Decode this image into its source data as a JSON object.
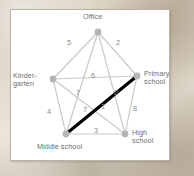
{
  "figure": {
    "type": "weighted-graph-diagram",
    "background": "#d8cfc0",
    "card_background": "#ffffff",
    "edge_color": "#c9c9c9",
    "node_color": "#b5b5b5",
    "highlight_color": "#000000",
    "label_color": "#6e6e6e",
    "weight_color": "#8a8a8a"
  },
  "nodes": [
    {
      "id": "office",
      "label": "Office",
      "x": 87,
      "y": 22,
      "label_x": 72,
      "label_y": 3,
      "label_lines": [
        "Office"
      ]
    },
    {
      "id": "kindergarten",
      "label": "Kinder-garten",
      "x": 42,
      "y": 69,
      "label_x": 2,
      "label_y": 62,
      "label_lines": [
        "Kinder-",
        "garten"
      ]
    },
    {
      "id": "primary_school",
      "label": "Primary school",
      "x": 126,
      "y": 66,
      "label_x": 133,
      "label_y": 60,
      "label_lines": [
        "Primary",
        "school"
      ]
    },
    {
      "id": "middle_school",
      "label": "Middle school",
      "x": 55,
      "y": 124,
      "label_x": 26,
      "label_y": 133,
      "label_lines": [
        "Middle school"
      ]
    },
    {
      "id": "high_school",
      "label": "High school",
      "x": 114,
      "y": 124,
      "label_x": 121,
      "label_y": 119,
      "label_lines": [
        "High",
        "school"
      ]
    }
  ],
  "edges": [
    {
      "from": "office",
      "to": "kindergarten",
      "weight": "5",
      "label_x": 56,
      "label_y": 29,
      "highlighted": false
    },
    {
      "from": "office",
      "to": "primary_school",
      "weight": "2",
      "label_x": 105,
      "label_y": 29,
      "highlighted": false
    },
    {
      "from": "office",
      "to": "middle_school",
      "weight": "6",
      "label_x": 80,
      "label_y": 62,
      "highlighted": false
    },
    {
      "from": "office",
      "to": "high_school",
      "weight": "2",
      "label_x": 103,
      "label_y": 79,
      "highlighted": false
    },
    {
      "from": "kindergarten",
      "to": "primary_school",
      "weight": "7",
      "label_x": 65,
      "label_y": 79,
      "highlighted": false
    },
    {
      "from": "kindergarten",
      "to": "middle_school",
      "weight": "4",
      "label_x": 36,
      "label_y": 98,
      "highlighted": false
    },
    {
      "from": "kindergarten",
      "to": "high_school",
      "weight": "7",
      "label_x": 72,
      "label_y": 96,
      "highlighted": false
    },
    {
      "from": "primary_school",
      "to": "high_school",
      "weight": "8",
      "label_x": 122,
      "label_y": 95,
      "highlighted": false
    },
    {
      "from": "primary_school",
      "to": "middle_school",
      "weight": "1",
      "label_x": 90,
      "label_y": 93,
      "highlighted": true
    },
    {
      "from": "middle_school",
      "to": "high_school",
      "weight": "3",
      "label_x": 83,
      "label_y": 117,
      "highlighted": false
    }
  ]
}
